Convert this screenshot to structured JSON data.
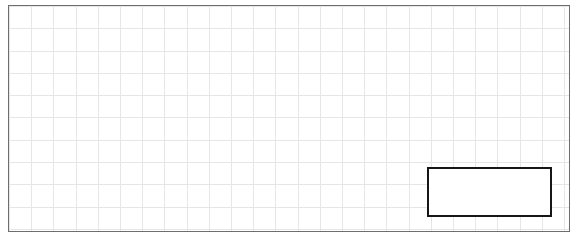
{
  "canvas": {
    "width": 581,
    "height": 241,
    "background_color": "#ffffff",
    "label": "Grid worksheet canvas"
  },
  "grid_frame": {
    "label": "Grid frame",
    "x": 8,
    "y": 5,
    "width": 562,
    "height": 227,
    "border_color": "#6e6e6e",
    "border_width": 1.5,
    "fill_color": "#ffffff"
  },
  "grid": {
    "label": "Background grid",
    "line_color": "#e6e6e6",
    "line_width": 1,
    "cell_width": 22.2,
    "cell_height": 22.3,
    "columns": 25,
    "rows": 10
  },
  "highlight_rect": {
    "label": "Highlighted rectangle",
    "x": 427,
    "y": 167,
    "width": 125,
    "height": 50,
    "border_color": "#161616",
    "border_width": 2.5,
    "fill_color": "#ffffff",
    "content": ""
  }
}
